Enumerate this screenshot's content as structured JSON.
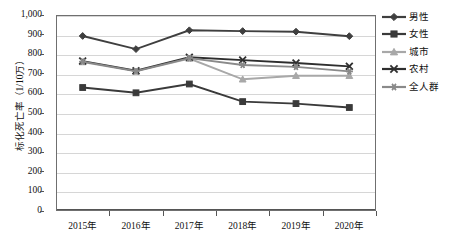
{
  "chart_data": {
    "type": "line",
    "title": "",
    "xlabel": "",
    "ylabel": "标化死亡率（1/10万）",
    "categories": [
      "2015年",
      "2016年",
      "2017年",
      "2018年",
      "2019年",
      "2020年"
    ],
    "ylim": [
      0,
      1000
    ],
    "ytick_labels": [
      "0",
      "100",
      "200",
      "300",
      "400",
      "500",
      "600",
      "700",
      "800",
      "900",
      "1,000"
    ],
    "ytick_values": [
      0,
      100,
      200,
      300,
      400,
      500,
      600,
      700,
      800,
      900,
      1000
    ],
    "grid": true,
    "legend_position": "right",
    "series": [
      {
        "name": "男性",
        "marker": "diamond",
        "color": "#3f3f3f",
        "values": [
          893,
          826,
          922,
          918,
          915,
          892
        ]
      },
      {
        "name": "女性",
        "marker": "square",
        "color": "#3a3a3a",
        "values": [
          630,
          603,
          648,
          558,
          548,
          528
        ]
      },
      {
        "name": "城市",
        "marker": "triangle",
        "color": "#a8a8a8",
        "values": [
          760,
          712,
          778,
          672,
          690,
          690
        ]
      },
      {
        "name": "农村",
        "marker": "cross",
        "color": "#2e2e2e",
        "values": [
          765,
          716,
          784,
          770,
          755,
          738
        ]
      },
      {
        "name": "全人群",
        "marker": "star",
        "color": "#8a8a8a",
        "values": [
          762,
          714,
          780,
          745,
          735,
          712
        ]
      }
    ]
  },
  "legend": {
    "items": [
      {
        "label": "男性"
      },
      {
        "label": "女性"
      },
      {
        "label": "城市"
      },
      {
        "label": "农村"
      },
      {
        "label": "全人群"
      }
    ]
  }
}
